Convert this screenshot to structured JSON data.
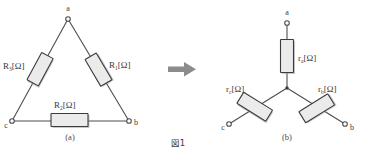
{
  "figure": {
    "caption": "図1",
    "arrow_icon": "right-arrow-icon"
  },
  "delta": {
    "sublabel": "(a)",
    "nodes": [
      {
        "id": "a",
        "label": "a"
      },
      {
        "id": "b",
        "label": "b"
      },
      {
        "id": "c",
        "label": "c"
      }
    ],
    "resistors": [
      {
        "id": "R3",
        "symbol": "R",
        "subscript": "3",
        "unit": "[Ω]",
        "position": "left"
      },
      {
        "id": "R1",
        "symbol": "R",
        "subscript": "1",
        "unit": "[Ω]",
        "position": "right"
      },
      {
        "id": "R2",
        "symbol": "R",
        "subscript": "2",
        "unit": "[Ω]",
        "position": "bottom"
      }
    ]
  },
  "wye": {
    "sublabel": "(b)",
    "nodes": [
      {
        "id": "a",
        "label": "a"
      },
      {
        "id": "b",
        "label": "b"
      },
      {
        "id": "c",
        "label": "c"
      }
    ],
    "resistors": [
      {
        "id": "ra",
        "symbol": "r",
        "subscript": "a",
        "unit": "[Ω]",
        "position": "top"
      },
      {
        "id": "rc",
        "symbol": "r",
        "subscript": "c",
        "unit": "[Ω]",
        "position": "lower-left"
      },
      {
        "id": "rb",
        "symbol": "r",
        "subscript": "b",
        "unit": "[Ω]",
        "position": "lower-right"
      }
    ]
  },
  "colors": {
    "wire": "#4d4d4d",
    "resistor_fill": "#ebebeb",
    "resistor_stroke": "#3c3c3c",
    "arrow": "#8c8c8c",
    "text": "#3a3a3a"
  }
}
